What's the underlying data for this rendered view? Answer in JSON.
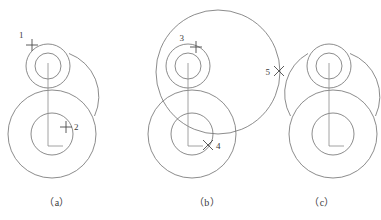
{
  "figure": {
    "background_color": "#ffffff",
    "line_color": "#6e6e6e",
    "centerline_color": "#8a8a8a",
    "marker_color": "#4a4a4a",
    "text_color": "#3a3a3a"
  },
  "captions": [
    {
      "id": "caption-a",
      "label": "（a）",
      "x": 57,
      "y": 206
    },
    {
      "id": "caption-b",
      "label": "（b）",
      "x": 207,
      "y": 206
    },
    {
      "id": "caption-c",
      "label": "（c）",
      "x": 322,
      "y": 206
    }
  ],
  "markers": [
    {
      "id": "marker-1",
      "label": "1",
      "glyph": "cross",
      "label_x": 19,
      "label_y": 38,
      "mark_x": 32,
      "mark_y": 45
    },
    {
      "id": "marker-2",
      "label": "2",
      "glyph": "cross",
      "label_x": 74,
      "label_y": 130,
      "mark_x": 66,
      "mark_y": 127
    },
    {
      "id": "marker-3",
      "label": "3",
      "glyph": "cross",
      "label_x": 184,
      "label_y": 41,
      "mark_x": 196,
      "mark_y": 47
    },
    {
      "id": "marker-4",
      "label": "4",
      "glyph": "x",
      "label_x": 216,
      "label_y": 149,
      "mark_x": 208,
      "mark_y": 145
    },
    {
      "id": "marker-5",
      "label": "5",
      "glyph": "x",
      "label_x": 265,
      "label_y": 74,
      "mark_x": 279,
      "mark_y": 71
    }
  ],
  "panels": [
    {
      "id": "panel-a",
      "caption": "（a）",
      "small_boss": {
        "cx": 48,
        "cy": 66,
        "r_outer": 22,
        "r_inner": 13
      },
      "large_boss": {
        "cx": 52,
        "cy": 134,
        "r_outer": 44,
        "r_inner": 21
      },
      "blend_arcs": [
        "right"
      ],
      "construction_circle": null
    },
    {
      "id": "panel-b",
      "caption": "（b）",
      "small_boss": {
        "cx": 188,
        "cy": 66,
        "r_outer": 22,
        "r_inner": 13
      },
      "large_boss": {
        "cx": 192,
        "cy": 134,
        "r_outer": 44,
        "r_inner": 21
      },
      "blend_arcs": [],
      "construction_circle": {
        "cx": 218,
        "cy": 72,
        "r": 62
      }
    },
    {
      "id": "panel-c",
      "caption": "（c）",
      "small_boss": {
        "cx": 329,
        "cy": 66,
        "r_outer": 22,
        "r_inner": 13
      },
      "large_boss": {
        "cx": 333,
        "cy": 134,
        "r_outer": 44,
        "r_inner": 21
      },
      "blend_arcs": [
        "left",
        "right"
      ],
      "construction_circle": null
    }
  ]
}
